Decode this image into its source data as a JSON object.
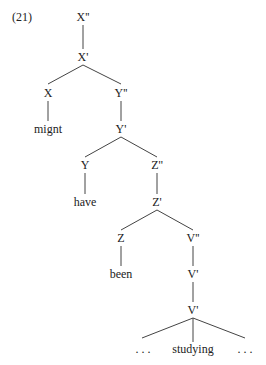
{
  "example_number": "(21)",
  "nodes": {
    "x2": "X''",
    "x1": "X'",
    "x0": "X",
    "might": "mignt",
    "y2": "Y''",
    "y1": "Y'",
    "y0": "Y",
    "have": "have",
    "z2": "Z''",
    "z1": "Z'",
    "z0": "Z",
    "been": "been",
    "v2": "V''",
    "v1a": "V'",
    "v1b": "V'",
    "dots_left": ". . .",
    "studying": "studying",
    "dots_right": ". . ."
  },
  "line_color": "#444444"
}
